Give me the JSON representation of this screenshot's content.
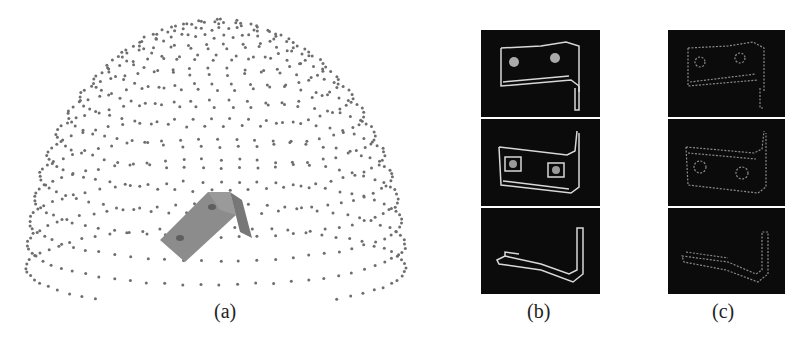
{
  "figure": {
    "panels": [
      {
        "id": "a",
        "caption": "(a)",
        "description": "Part model centered inside hemispherical grid of viewpoint samples"
      },
      {
        "id": "b",
        "caption": "(b)",
        "description": "Rendered edge views of part from three viewpoints"
      },
      {
        "id": "c",
        "caption": "(c)",
        "description": "Sparse sampled edge point views of part from three viewpoints"
      }
    ],
    "colors": {
      "background": "#ffffff",
      "dot": "#6e6e6e",
      "panel_bg": "#0b0b0b",
      "edge_bright": "#d8d8d8",
      "edge_dim": "#8a8a8a",
      "part_fill": "#8c8c8c"
    }
  }
}
